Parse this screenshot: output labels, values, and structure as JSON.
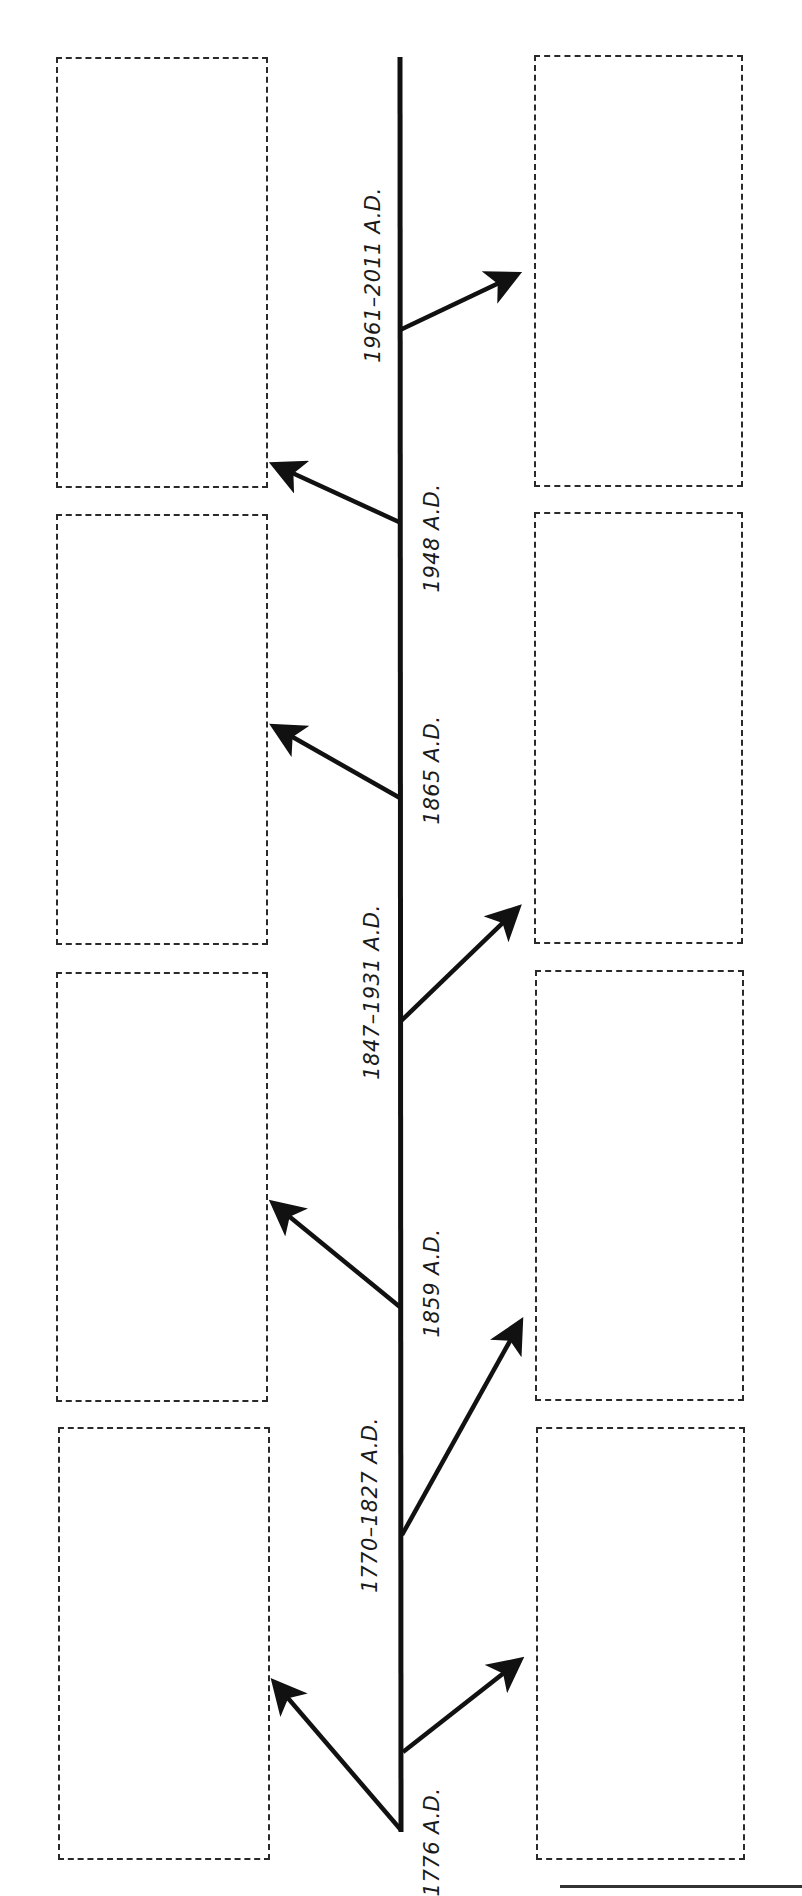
{
  "diagram": {
    "type": "vertical-timeline-worksheet",
    "timeline": {
      "x": 400,
      "y_top": 57,
      "y_bottom": 1832,
      "color": "#111111"
    },
    "events": [
      {
        "label": "1961–2011 A.D.",
        "side_of_label": "left",
        "label_x": 373,
        "label_y": 275,
        "branch_y": 330,
        "arrow_to": "right",
        "tip": [
          522,
          272
        ]
      },
      {
        "label": "1948 A.D.",
        "side_of_label": "right",
        "label_x": 432,
        "label_y": 538,
        "branch_y": 522,
        "arrow_to": "left",
        "tip": [
          268,
          462
        ]
      },
      {
        "label": "1865 A.D.",
        "side_of_label": "right",
        "label_x": 432,
        "label_y": 770,
        "branch_y": 798,
        "arrow_to": "left",
        "tip": [
          268,
          723
        ]
      },
      {
        "label": "1847–1931 A.D.",
        "side_of_label": "left",
        "label_x": 372,
        "label_y": 992,
        "branch_y": 1022,
        "arrow_to": "right",
        "tip": [
          523,
          903
        ]
      },
      {
        "label": "1859 A.D.",
        "side_of_label": "right",
        "label_x": 432,
        "label_y": 1283,
        "branch_y": 1307,
        "arrow_to": "left",
        "tip": [
          268,
          1199
        ]
      },
      {
        "label": "1770–1827 A.D.",
        "side_of_label": "left",
        "label_x": 370,
        "label_y": 1505,
        "branch_y": 1535,
        "arrow_to": "right",
        "tip": [
          524,
          1316
        ]
      },
      {
        "label": "1776 A.D.",
        "side_of_label": "right",
        "label_x": 432,
        "label_y": 1842,
        "branch_y": 1830,
        "arrow_to": "left",
        "tip": [
          270,
          1677
        ]
      },
      {
        "label": "",
        "side_of_label": "none",
        "branch_y": 1752,
        "arrow_to": "right",
        "tip": [
          525,
          1657
        ]
      }
    ],
    "boxes": {
      "left": [
        {
          "x": 56,
          "y": 57,
          "w": 212,
          "h": 431
        },
        {
          "x": 56,
          "y": 514,
          "w": 212,
          "h": 431
        },
        {
          "x": 56,
          "y": 972,
          "w": 212,
          "h": 430
        },
        {
          "x": 58,
          "y": 1427,
          "w": 212,
          "h": 433
        }
      ],
      "right": [
        {
          "x": 534,
          "y": 55,
          "w": 209,
          "h": 432
        },
        {
          "x": 534,
          "y": 512,
          "w": 209,
          "h": 432
        },
        {
          "x": 535,
          "y": 970,
          "w": 209,
          "h": 431
        },
        {
          "x": 536,
          "y": 1427,
          "w": 209,
          "h": 433
        }
      ]
    }
  },
  "labels": {
    "e1961": "1961–2011 A.D.",
    "e1948": "1948 A.D.",
    "e1865": "1865 A.D.",
    "e1847": "1847–1931 A.D.",
    "e1859": "1859 A.D.",
    "e1770": "1770–1827 A.D.",
    "e1776": "1776 A.D."
  },
  "colors": {
    "line": "#111111",
    "box_border": "#2a2a2a",
    "background": "#ffffff"
  }
}
